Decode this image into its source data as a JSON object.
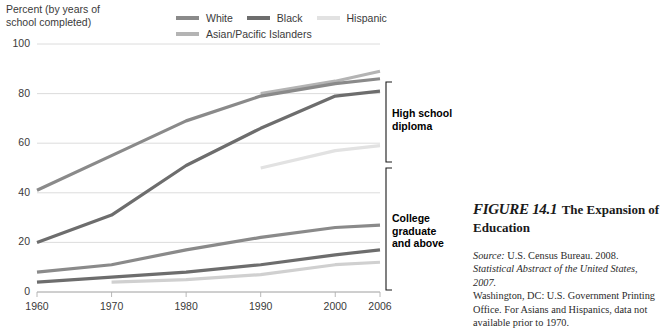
{
  "axis_title": "Percent (by years of\nschool completed)",
  "legend": {
    "rows": [
      [
        {
          "label": "White",
          "color": "#8a8a8a"
        },
        {
          "label": "Black",
          "color": "#6d6d6d"
        },
        {
          "label": "Hispanic",
          "color": "#e2e2e2"
        }
      ],
      [
        {
          "label": "Asian/Pacific Islanders",
          "color": "#b4b4b4"
        }
      ]
    ]
  },
  "brackets": [
    {
      "name": "high-school",
      "label": "High school\ndiploma",
      "top": 82,
      "bottom": 162,
      "text_top": 107
    },
    {
      "name": "college",
      "label": "College\ngraduate\nand above",
      "top": 168,
      "bottom": 290,
      "text_top": 212
    }
  ],
  "caption": {
    "figure_number": "FIGURE 14.1",
    "title": "The Expansion of Education"
  },
  "source": {
    "lines": [
      {
        "italic": "Source:",
        "rest": " U.S. Census Bureau. 2008."
      },
      {
        "italic": "Statistical Abstract of the United States, 2007.",
        "rest": ""
      },
      {
        "italic": "",
        "rest": "Washington, DC: U.S. Government Printing"
      },
      {
        "italic": "",
        "rest": "Office. For Asians and Hispanics, data not"
      },
      {
        "italic": "",
        "rest": "available prior to 1970."
      }
    ]
  },
  "chart_data": {
    "type": "line",
    "title": "The Expansion of Education",
    "xlabel": "",
    "ylabel": "Percent (by years of school completed)",
    "xlim": [
      1960,
      2006
    ],
    "ylim": [
      0,
      100
    ],
    "yticks": [
      0,
      20,
      40,
      60,
      80,
      100
    ],
    "xticks": [
      1960,
      1970,
      1980,
      1990,
      2000,
      2006
    ],
    "grid": "horizontal",
    "legend_position": "top",
    "groups": [
      {
        "name": "High school diploma",
        "series": [
          {
            "name": "White",
            "color": "#8a8a8a",
            "width": 3.2,
            "x": [
              1960,
              1970,
              1980,
              1990,
              2000,
              2006
            ],
            "values": [
              41,
              55,
              69,
              79,
              84,
              86
            ]
          },
          {
            "name": "Black",
            "color": "#6d6d6d",
            "width": 3.2,
            "x": [
              1960,
              1970,
              1980,
              1990,
              2000,
              2006
            ],
            "values": [
              20,
              31,
              51,
              66,
              79,
              81
            ]
          },
          {
            "name": "Hispanic",
            "color": "#e2e2e2",
            "width": 3.2,
            "x": [
              1990,
              2000,
              2006
            ],
            "values": [
              50,
              57,
              59
            ]
          },
          {
            "name": "Asian/Pacific Islanders",
            "color": "#b4b4b4",
            "width": 3.2,
            "x": [
              1990,
              2000,
              2006
            ],
            "values": [
              80,
              85,
              89
            ]
          }
        ]
      },
      {
        "name": "College graduate and above",
        "series": [
          {
            "name": "White",
            "color": "#8a8a8a",
            "width": 3.2,
            "x": [
              1960,
              1970,
              1980,
              1990,
              2000,
              2006
            ],
            "values": [
              8,
              11,
              17,
              22,
              26,
              27
            ]
          },
          {
            "name": "Black",
            "color": "#6d6d6d",
            "width": 3.2,
            "x": [
              1960,
              1970,
              1980,
              1990,
              2000,
              2006
            ],
            "values": [
              4,
              6,
              8,
              11,
              15,
              17
            ]
          },
          {
            "name": "Hispanic",
            "color": "#d0d0d0",
            "width": 3.2,
            "x": [
              1970,
              1980,
              1990,
              2000,
              2006
            ],
            "values": [
              4,
              5,
              7,
              11,
              12
            ]
          }
        ]
      }
    ]
  }
}
